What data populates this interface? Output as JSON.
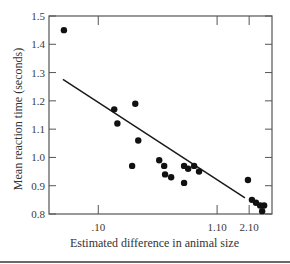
{
  "chart_data": {
    "type": "scatter",
    "title": "",
    "xlabel": "Estimated difference in animal size",
    "ylabel": "Mean reaction time (seconds)",
    "x_scale": "log",
    "xlim": [
      0.037,
      3.33
    ],
    "ylim": [
      0.8,
      1.5
    ],
    "x_ticks": [
      {
        "value": 0.1,
        "label": ".10"
      },
      {
        "value": 1.1,
        "label": "1.10"
      },
      {
        "value": 2.1,
        "label": "2.10"
      }
    ],
    "y_ticks": [
      {
        "value": 0.8,
        "label": "0.8"
      },
      {
        "value": 0.9,
        "label": "0.9"
      },
      {
        "value": 1.0,
        "label": "1.0"
      },
      {
        "value": 1.1,
        "label": "1.1"
      },
      {
        "value": 1.2,
        "label": "1.2"
      },
      {
        "value": 1.3,
        "label": "1.3"
      },
      {
        "value": 1.4,
        "label": "1.4"
      },
      {
        "value": 1.5,
        "label": "1.5"
      }
    ],
    "grid": false,
    "points": [
      {
        "x": 0.05,
        "y": 1.45
      },
      {
        "x": 0.138,
        "y": 1.17
      },
      {
        "x": 0.147,
        "y": 1.12
      },
      {
        "x": 0.211,
        "y": 1.19
      },
      {
        "x": 0.198,
        "y": 0.97
      },
      {
        "x": 0.224,
        "y": 1.06
      },
      {
        "x": 0.342,
        "y": 0.99
      },
      {
        "x": 0.378,
        "y": 0.97
      },
      {
        "x": 0.385,
        "y": 0.94
      },
      {
        "x": 0.435,
        "y": 0.93
      },
      {
        "x": 0.565,
        "y": 0.91
      },
      {
        "x": 0.565,
        "y": 0.97
      },
      {
        "x": 0.613,
        "y": 0.96
      },
      {
        "x": 0.692,
        "y": 0.97
      },
      {
        "x": 0.764,
        "y": 0.95
      },
      {
        "x": 2.05,
        "y": 0.92
      },
      {
        "x": 2.22,
        "y": 0.85
      },
      {
        "x": 2.41,
        "y": 0.84
      },
      {
        "x": 2.62,
        "y": 0.83
      },
      {
        "x": 2.73,
        "y": 0.81
      },
      {
        "x": 2.84,
        "y": 0.83
      }
    ],
    "fit_line": {
      "x1": 0.049,
      "y1": 1.276,
      "x2": 1.93,
      "y2": 0.857
    },
    "colors": {
      "points": "#111111",
      "line": "#1a1a1a",
      "axes": "#555555"
    }
  }
}
